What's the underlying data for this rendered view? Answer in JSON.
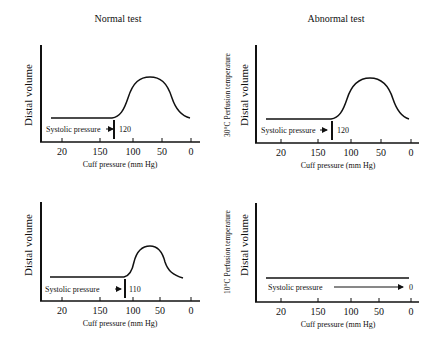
{
  "columns": {
    "left_title": "Normal test",
    "right_title": "Abnormal test"
  },
  "panels": [
    {
      "id": "normal-top",
      "side_label": "",
      "ylabel": "Distal volume",
      "xlabel": "Cuff pressure (mm Hg)",
      "ticks": [
        "20",
        "150",
        "100",
        "50",
        "0"
      ],
      "systolic_label": "Systolic pressure",
      "systolic_value": "120"
    },
    {
      "id": "abnormal-top",
      "side_label": "30°C Perfusion temperature",
      "ylabel": "Distal volume",
      "xlabel": "Cuff pressure (mm Hg)",
      "ticks": [
        "20",
        "150",
        "100",
        "50",
        "0"
      ],
      "systolic_label": "Systolic pressure",
      "systolic_value": "120"
    },
    {
      "id": "normal-bottom",
      "side_label": "",
      "ylabel": "Distal volume",
      "xlabel": "Cuff pressure (mm Hg)",
      "ticks": [
        "20",
        "150",
        "100",
        "50",
        "0"
      ],
      "systolic_label": "Systolic pressure",
      "systolic_value": "110"
    },
    {
      "id": "abnormal-bottom",
      "side_label": "10°C Perfusion temperature",
      "ylabel": "Distal volume",
      "xlabel": "Cuff pressure (mm Hg)",
      "ticks": [
        "20",
        "150",
        "100",
        "50",
        "0"
      ],
      "systolic_label": "Systolic pressure",
      "systolic_value": "0"
    }
  ]
}
